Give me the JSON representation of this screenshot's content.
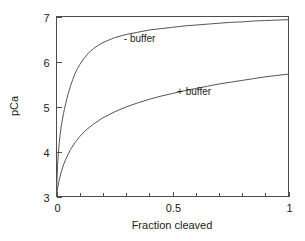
{
  "chart_data": {
    "type": "line",
    "title": "",
    "xlabel": "Fraction cleaved",
    "ylabel": "pCa",
    "xlim": [
      0,
      1
    ],
    "ylim": [
      3,
      7
    ],
    "grid": false,
    "legend_position": "inline-annotations",
    "x_ticks": [
      0,
      0.1,
      0.2,
      0.3,
      0.4,
      0.5,
      0.6,
      0.7,
      0.8,
      0.9,
      1
    ],
    "x_tick_labels": [
      "0",
      "",
      "",
      "",
      "",
      "0.5",
      "",
      "",
      "",
      "",
      "1"
    ],
    "y_ticks": [
      3,
      4,
      5,
      6,
      7
    ],
    "y_tick_labels": [
      "3",
      "4",
      "5",
      "6",
      "7"
    ],
    "series": [
      {
        "name": "- buffer",
        "label": "- buffer",
        "label_x": 0.29,
        "label_y": 6.44,
        "x": [
          0,
          0.002,
          0.005,
          0.008,
          0.012,
          0.016,
          0.02,
          0.025,
          0.03,
          0.035,
          0.04,
          0.045,
          0.05,
          0.06,
          0.07,
          0.08,
          0.09,
          0.1,
          0.12,
          0.14,
          0.16,
          0.18,
          0.2,
          0.25,
          0.3,
          0.35,
          0.4,
          0.45,
          0.5,
          0.55,
          0.6,
          0.65,
          0.7,
          0.75,
          0.8,
          0.85,
          0.9,
          0.95,
          1
        ],
        "y": [
          3.0,
          3.35,
          3.72,
          3.96,
          4.2,
          4.39,
          4.54,
          4.7,
          4.84,
          4.96,
          5.07,
          5.18,
          5.28,
          5.45,
          5.6,
          5.73,
          5.84,
          5.93,
          6.08,
          6.2,
          6.29,
          6.36,
          6.42,
          6.53,
          6.6,
          6.65,
          6.7,
          6.73,
          6.76,
          6.79,
          6.81,
          6.83,
          6.85,
          6.87,
          6.88,
          6.9,
          6.91,
          6.92,
          6.93
        ]
      },
      {
        "name": "+ buffer",
        "label": "+ buffer",
        "label_x": 0.52,
        "label_y": 5.26,
        "x": [
          0,
          0.005,
          0.01,
          0.02,
          0.03,
          0.04,
          0.05,
          0.06,
          0.08,
          0.1,
          0.12,
          0.14,
          0.16,
          0.18,
          0.2,
          0.25,
          0.3,
          0.35,
          0.4,
          0.45,
          0.5,
          0.55,
          0.6,
          0.65,
          0.7,
          0.75,
          0.8,
          0.85,
          0.9,
          0.95,
          1
        ],
        "y": [
          3.0,
          3.2,
          3.33,
          3.54,
          3.7,
          3.83,
          3.94,
          4.04,
          4.2,
          4.33,
          4.44,
          4.53,
          4.61,
          4.68,
          4.75,
          4.88,
          4.99,
          5.08,
          5.16,
          5.23,
          5.29,
          5.35,
          5.4,
          5.45,
          5.5,
          5.54,
          5.58,
          5.62,
          5.66,
          5.69,
          5.72
        ]
      }
    ],
    "colors": {
      "curve": "#555555",
      "axis": "#4d4d4d",
      "text": "#1a1a1a",
      "background": "#ffffff"
    }
  }
}
